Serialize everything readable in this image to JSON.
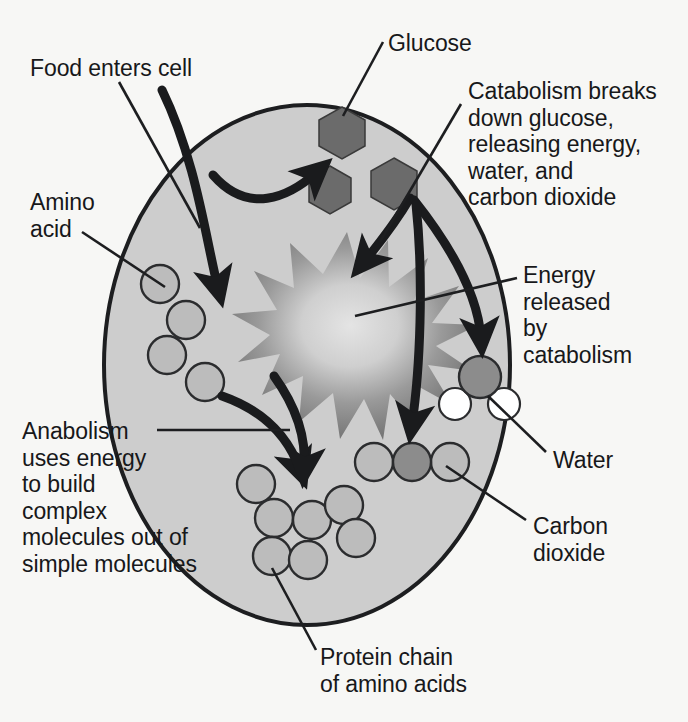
{
  "diagram": {
    "labels": {
      "food_enters_cell": "Food enters cell",
      "glucose": "Glucose",
      "catabolism": "Catabolism breaks\ndown glucose,\nreleasing energy,\nwater, and\ncarbon dioxide",
      "amino_acid": "Amino\nacid",
      "energy_released": "Energy\nreleased\nby\ncatabolism",
      "water": "Water",
      "anabolism": "Anabolism\nuses energy\nto build\ncomplex\nmolecules out of\nsimple molecules",
      "carbon_dioxide": "Carbon\ndioxide",
      "protein_chain": "Protein chain\nof amino acids"
    },
    "colors": {
      "page_background": "#f7f7f5",
      "cell_fill": "#cdcdcd",
      "cell_stroke": "#1d1e20",
      "glucose_fill": "#6e6e6e",
      "amino_acid_fill": "#bcbcbc",
      "molecule_dark": "#8c8c8c",
      "molecule_light": "#ffffff",
      "energy_burst_outer": "#7d7d7d",
      "energy_burst_inner": "#d8d8d8",
      "text": "#17181a",
      "arrow": "#1a1b1d"
    },
    "shapes": {
      "cell": {
        "cx": 307,
        "cy": 365,
        "rx": 203,
        "ry": 260
      },
      "glucose_hexagons": [
        {
          "cx": 342,
          "cy": 133,
          "r": 26
        },
        {
          "cx": 330,
          "cy": 190,
          "r": 24
        },
        {
          "cx": 394,
          "cy": 184,
          "r": 26
        }
      ],
      "amino_acid_circles": [
        {
          "cx": 160,
          "cy": 284,
          "r": 19
        },
        {
          "cx": 186,
          "cy": 320,
          "r": 19
        },
        {
          "cx": 167,
          "cy": 355,
          "r": 19
        },
        {
          "cx": 205,
          "cy": 382,
          "r": 19
        }
      ],
      "energy_burst": {
        "cx": 347,
        "cy": 318,
        "points": 14,
        "outer_r": 86,
        "inner_r": 36
      },
      "water_molecule": {
        "oxygen": {
          "cx": 480,
          "cy": 377,
          "r": 21
        },
        "hydrogens": [
          {
            "cx": 455,
            "cy": 404,
            "r": 16
          },
          {
            "cx": 504,
            "cy": 404,
            "r": 16
          }
        ]
      },
      "carbon_dioxide_molecule": {
        "carbon": {
          "cx": 412,
          "cy": 462,
          "r": 19
        },
        "oxygens": [
          {
            "cx": 374,
            "cy": 462,
            "r": 19
          },
          {
            "cx": 450,
            "cy": 462,
            "r": 19
          }
        ]
      },
      "protein_chain_circles": [
        {
          "cx": 256,
          "cy": 484
        },
        {
          "cx": 274,
          "cy": 518
        },
        {
          "cx": 272,
          "cy": 556
        },
        {
          "cx": 308,
          "cy": 560
        },
        {
          "cx": 312,
          "cy": 520
        },
        {
          "cx": 344,
          "cy": 505
        },
        {
          "cx": 356,
          "cy": 538
        }
      ]
    }
  }
}
